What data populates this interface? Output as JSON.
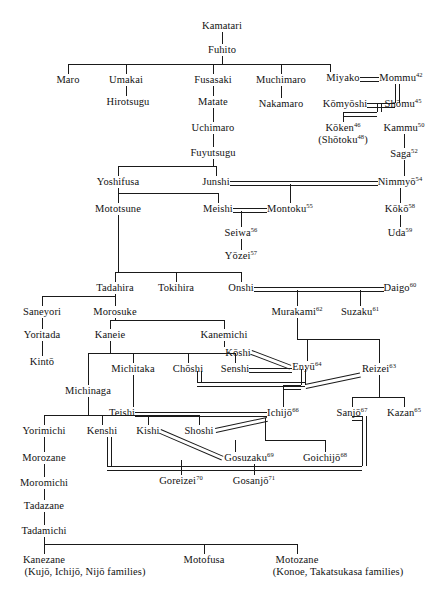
{
  "figure": {
    "caption": ""
  },
  "chart_data": {
    "type": "diagram",
    "generations": 18,
    "legend": {
      "single_line": "parent-child descent",
      "double_line": "marriage"
    },
    "nodes": [
      {
        "id": "kamatari",
        "label": "Kamatari",
        "x": 222,
        "y": 20
      },
      {
        "id": "fuhito",
        "label": "Fuhito",
        "x": 222,
        "y": 44
      },
      {
        "id": "maro",
        "label": "Maro",
        "x": 68,
        "y": 74
      },
      {
        "id": "umakai",
        "label": "Umakai",
        "x": 126,
        "y": 74
      },
      {
        "id": "fusasaki",
        "label": "Fusasaki",
        "x": 213,
        "y": 74
      },
      {
        "id": "muchimaro",
        "label": "Muchimaro",
        "x": 281,
        "y": 74
      },
      {
        "id": "miyako",
        "label": "Miyako",
        "x": 343,
        "y": 72
      },
      {
        "id": "mommu",
        "label": "Mommu",
        "sup": "42",
        "x": 401,
        "y": 72
      },
      {
        "id": "hirotsugu",
        "label": "Hirotsugu",
        "x": 128,
        "y": 96
      },
      {
        "id": "matate",
        "label": "Matate",
        "x": 213,
        "y": 96
      },
      {
        "id": "nakamaro",
        "label": "Nakamaro",
        "x": 281,
        "y": 98
      },
      {
        "id": "komyoshi",
        "label": "Kōmyōshi",
        "x": 345,
        "y": 98
      },
      {
        "id": "shomu",
        "label": "Shōmu",
        "sup": "45",
        "x": 403,
        "y": 98
      },
      {
        "id": "uchimaro",
        "label": "Uchimaro",
        "x": 213,
        "y": 122
      },
      {
        "id": "koken",
        "label": "Kōken",
        "sup": "46",
        "x": 343,
        "y": 122
      },
      {
        "id": "shotoku",
        "label": "(Shōtoku",
        "sup": "48",
        "suffix": ")",
        "x": 343,
        "y": 134
      },
      {
        "id": "kammu",
        "label": "Kammu",
        "sup": "50",
        "x": 404,
        "y": 122
      },
      {
        "id": "fuyutsugu",
        "label": "Fuyutsugu",
        "x": 213,
        "y": 147
      },
      {
        "id": "saga",
        "label": "Saga",
        "sup": "52",
        "x": 404,
        "y": 148
      },
      {
        "id": "yoshifusa",
        "label": "Yoshifusa",
        "x": 118,
        "y": 176
      },
      {
        "id": "junshi",
        "label": "Junshi",
        "x": 216,
        "y": 176
      },
      {
        "id": "nimmyo",
        "label": "Nimmyō",
        "sup": "54",
        "x": 400,
        "y": 176
      },
      {
        "id": "mototsune",
        "label": "Mototsune",
        "x": 118,
        "y": 203
      },
      {
        "id": "meishi",
        "label": "Meishi",
        "x": 218,
        "y": 203
      },
      {
        "id": "montoku",
        "label": "Montoku",
        "sup": "55",
        "x": 290,
        "y": 203
      },
      {
        "id": "koko",
        "label": "Kōkō",
        "sup": "58",
        "x": 400,
        "y": 203
      },
      {
        "id": "seiwa",
        "label": "Seiwa",
        "sup": "56",
        "x": 241,
        "y": 227
      },
      {
        "id": "uda",
        "label": "Uda",
        "sup": "59",
        "x": 400,
        "y": 227
      },
      {
        "id": "yozei",
        "label": "Yōzei",
        "sup": "57",
        "x": 241,
        "y": 250
      },
      {
        "id": "tadahira",
        "label": "Tadahira",
        "x": 115,
        "y": 282
      },
      {
        "id": "tokihira",
        "label": "Tokihira",
        "x": 176,
        "y": 282
      },
      {
        "id": "onshi",
        "label": "Onshi",
        "x": 241,
        "y": 282
      },
      {
        "id": "daigo",
        "label": "Daigo",
        "sup": "60",
        "x": 400,
        "y": 282
      },
      {
        "id": "saneyori",
        "label": "Saneyori",
        "x": 42,
        "y": 306
      },
      {
        "id": "morosuke",
        "label": "Morosuke",
        "x": 115,
        "y": 306
      },
      {
        "id": "murakami",
        "label": "Murakami",
        "sup": "62",
        "x": 297,
        "y": 306
      },
      {
        "id": "suzaku",
        "label": "Suzaku",
        "sup": "61",
        "x": 360,
        "y": 306
      },
      {
        "id": "yoritada",
        "label": "Yoritada",
        "x": 42,
        "y": 329
      },
      {
        "id": "kaneie",
        "label": "Kaneie",
        "x": 110,
        "y": 329
      },
      {
        "id": "kanemichi",
        "label": "Kanemichi",
        "x": 224,
        "y": 329
      },
      {
        "id": "koshi",
        "label": "Kōshi",
        "x": 238,
        "y": 347
      },
      {
        "id": "kinto",
        "label": "Kintō",
        "x": 42,
        "y": 356
      },
      {
        "id": "michitaka",
        "label": "Michitaka",
        "x": 133,
        "y": 363
      },
      {
        "id": "choshi",
        "label": "Chōshi",
        "x": 188,
        "y": 363
      },
      {
        "id": "senshi",
        "label": "Senshi",
        "x": 235,
        "y": 363
      },
      {
        "id": "enyu",
        "label": "Enyū",
        "sup": "64",
        "x": 307,
        "y": 361
      },
      {
        "id": "reizei",
        "label": "Reizei",
        "sup": "63",
        "x": 379,
        "y": 363
      },
      {
        "id": "michinaga",
        "label": "Michinaga",
        "x": 88,
        "y": 385
      },
      {
        "id": "teishi",
        "label": "Teishi",
        "x": 122,
        "y": 407
      },
      {
        "id": "ichijo",
        "label": "Ichijō",
        "sup": "66",
        "x": 283,
        "y": 407
      },
      {
        "id": "sanjo",
        "label": "Sanjō",
        "sup": "67",
        "x": 352,
        "y": 407
      },
      {
        "id": "kazan",
        "label": "Kazan",
        "sup": "65",
        "x": 404,
        "y": 407
      },
      {
        "id": "yorimichi",
        "label": "Yorimichi",
        "x": 44,
        "y": 425
      },
      {
        "id": "kenshi",
        "label": "Kenshi",
        "x": 102,
        "y": 425
      },
      {
        "id": "kishi",
        "label": "Kishi",
        "x": 148,
        "y": 425
      },
      {
        "id": "shoshi",
        "label": "Shoshi",
        "x": 199,
        "y": 425
      },
      {
        "id": "morozane",
        "label": "Morozane",
        "x": 44,
        "y": 452
      },
      {
        "id": "gosuzaku",
        "label": "Gosuzaku",
        "sup": "69",
        "x": 249,
        "y": 452
      },
      {
        "id": "goichijo",
        "label": "Goichijō",
        "sup": "68",
        "x": 325,
        "y": 452
      },
      {
        "id": "moromichi",
        "label": "Moromichi",
        "x": 44,
        "y": 477
      },
      {
        "id": "goreizei",
        "label": "Goreizei",
        "sup": "70",
        "x": 181,
        "y": 475
      },
      {
        "id": "gosanjo",
        "label": "Gosanjō",
        "sup": "71",
        "x": 254,
        "y": 475
      },
      {
        "id": "tadazane",
        "label": "Tadazane",
        "x": 44,
        "y": 500
      },
      {
        "id": "tadamichi",
        "label": "Tadamichi",
        "x": 44,
        "y": 525
      },
      {
        "id": "kanezane",
        "label": "Kanezane",
        "x": 44,
        "y": 554
      },
      {
        "id": "kanezane_fam",
        "label": "(Kujō, Ichijō, Nijō families)",
        "x": 85,
        "y": 566
      },
      {
        "id": "motofusa",
        "label": "Motofusa",
        "x": 204,
        "y": 554
      },
      {
        "id": "motozane",
        "label": "Motozane",
        "x": 297,
        "y": 554
      },
      {
        "id": "motozane_fam",
        "label": "(Konoe, Takatsukasa families)",
        "x": 338,
        "y": 566
      }
    ],
    "marriages": [
      {
        "a": "miyako",
        "b": "mommu"
      },
      {
        "a": "komyoshi",
        "b": "shomu"
      },
      {
        "a": "junshi",
        "b": "nimmyo"
      },
      {
        "a": "meishi",
        "b": "montoku"
      },
      {
        "a": "onshi",
        "b": "daigo"
      },
      {
        "a": "koshi",
        "b": "enyu"
      },
      {
        "a": "senshi",
        "b": "enyu"
      },
      {
        "a": "choshi",
        "b": "reizei"
      },
      {
        "a": "teishi",
        "b": "ichijo"
      },
      {
        "a": "shoshi",
        "b": "ichijo"
      },
      {
        "a": "kishi",
        "b": "gosuzaku"
      },
      {
        "a": "kenshi",
        "b": "sanjo"
      }
    ]
  }
}
